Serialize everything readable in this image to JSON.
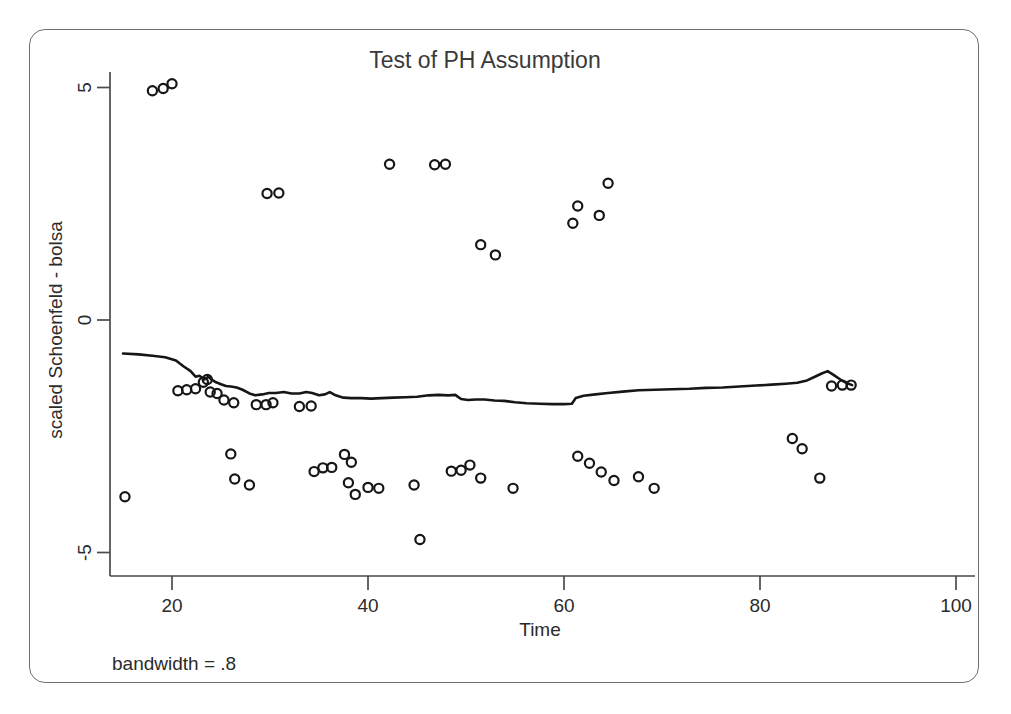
{
  "figure": {
    "title": "Test of PH Assumption",
    "note": "bandwidth = .8",
    "background": "#ffffff",
    "frame_color": "#6f6f6f",
    "marker_color": "#161616",
    "line_color": "#161616"
  },
  "chart_data": {
    "type": "scatter",
    "title": "Test of PH Assumption",
    "xlabel": "Time",
    "ylabel": "scaled Schoenfeld - bolsa",
    "xlim": [
      13.5,
      104
    ],
    "ylim": [
      -5.9,
      5.9
    ],
    "xticks": [
      20,
      40,
      60,
      80,
      100
    ],
    "yticks": [
      5,
      0,
      -5
    ],
    "xtick_labels": [
      "20",
      "40",
      "60",
      "80",
      "100"
    ],
    "ytick_labels": [
      "5",
      "0",
      "-5"
    ],
    "grid": false,
    "legend": "none",
    "annotations": [
      "bandwidth = .8"
    ],
    "series": [
      {
        "name": "scaled Schoenfeld residuals",
        "type": "scatter",
        "marker": "open-circle",
        "points": [
          [
            18.0,
            4.93
          ],
          [
            19.1,
            4.98
          ],
          [
            20.0,
            5.08
          ],
          [
            15.2,
            -3.8
          ],
          [
            20.6,
            -1.52
          ],
          [
            21.5,
            -1.5
          ],
          [
            22.4,
            -1.48
          ],
          [
            23.2,
            -1.34
          ],
          [
            23.6,
            -1.28
          ],
          [
            23.9,
            -1.55
          ],
          [
            24.6,
            -1.58
          ],
          [
            25.3,
            -1.72
          ],
          [
            26.3,
            -1.78
          ],
          [
            26.0,
            -2.88
          ],
          [
            26.4,
            -3.42
          ],
          [
            27.9,
            -3.55
          ],
          [
            28.6,
            -1.82
          ],
          [
            29.6,
            -1.82
          ],
          [
            30.3,
            -1.78
          ],
          [
            29.7,
            2.72
          ],
          [
            30.9,
            2.73
          ],
          [
            33.0,
            -1.86
          ],
          [
            34.2,
            -1.85
          ],
          [
            34.5,
            -3.26
          ],
          [
            35.4,
            -3.18
          ],
          [
            36.3,
            -3.17
          ],
          [
            37.6,
            -2.89
          ],
          [
            38.3,
            -3.06
          ],
          [
            38.0,
            -3.5
          ],
          [
            38.7,
            -3.75
          ],
          [
            40.0,
            -3.6
          ],
          [
            41.1,
            -3.62
          ],
          [
            42.2,
            3.35
          ],
          [
            45.3,
            -4.72
          ],
          [
            44.7,
            -3.55
          ],
          [
            46.8,
            3.34
          ],
          [
            47.9,
            3.35
          ],
          [
            48.5,
            -3.25
          ],
          [
            49.5,
            -3.23
          ],
          [
            50.4,
            -3.12
          ],
          [
            51.5,
            -3.4
          ],
          [
            51.5,
            1.62
          ],
          [
            53.0,
            1.4
          ],
          [
            54.8,
            -3.62
          ],
          [
            60.9,
            2.08
          ],
          [
            61.4,
            2.45
          ],
          [
            63.6,
            2.25
          ],
          [
            64.5,
            2.94
          ],
          [
            61.4,
            -2.93
          ],
          [
            62.6,
            -3.08
          ],
          [
            63.8,
            -3.27
          ],
          [
            65.1,
            -3.45
          ],
          [
            67.6,
            -3.37
          ],
          [
            69.2,
            -3.62
          ],
          [
            83.3,
            -2.55
          ],
          [
            84.3,
            -2.77
          ],
          [
            86.1,
            -3.4
          ],
          [
            87.3,
            -1.42
          ],
          [
            88.4,
            -1.4
          ],
          [
            89.3,
            -1.4
          ]
        ]
      },
      {
        "name": "lowess smooth",
        "type": "line",
        "points": [
          [
            15.0,
            -0.72
          ],
          [
            16.6,
            -0.74
          ],
          [
            18.0,
            -0.77
          ],
          [
            19.3,
            -0.8
          ],
          [
            20.4,
            -0.87
          ],
          [
            21.2,
            -1.0
          ],
          [
            21.9,
            -1.1
          ],
          [
            22.4,
            -1.22
          ],
          [
            22.8,
            -1.2
          ],
          [
            23.3,
            -1.28
          ],
          [
            23.7,
            -1.22
          ],
          [
            24.1,
            -1.29
          ],
          [
            24.5,
            -1.34
          ],
          [
            25.0,
            -1.38
          ],
          [
            25.5,
            -1.42
          ],
          [
            26.0,
            -1.43
          ],
          [
            26.6,
            -1.45
          ],
          [
            27.2,
            -1.5
          ],
          [
            27.9,
            -1.58
          ],
          [
            28.5,
            -1.62
          ],
          [
            29.2,
            -1.6
          ],
          [
            29.9,
            -1.57
          ],
          [
            30.6,
            -1.57
          ],
          [
            31.4,
            -1.55
          ],
          [
            32.2,
            -1.58
          ],
          [
            33.0,
            -1.58
          ],
          [
            33.7,
            -1.55
          ],
          [
            34.3,
            -1.57
          ],
          [
            35.0,
            -1.62
          ],
          [
            35.6,
            -1.6
          ],
          [
            36.1,
            -1.55
          ],
          [
            36.7,
            -1.62
          ],
          [
            37.5,
            -1.67
          ],
          [
            38.3,
            -1.68
          ],
          [
            39.3,
            -1.68
          ],
          [
            40.3,
            -1.69
          ],
          [
            41.4,
            -1.68
          ],
          [
            42.6,
            -1.67
          ],
          [
            43.8,
            -1.66
          ],
          [
            45.0,
            -1.65
          ],
          [
            46.2,
            -1.62
          ],
          [
            47.2,
            -1.61
          ],
          [
            48.2,
            -1.62
          ],
          [
            48.9,
            -1.61
          ],
          [
            49.5,
            -1.7
          ],
          [
            50.2,
            -1.72
          ],
          [
            51.0,
            -1.71
          ],
          [
            51.9,
            -1.71
          ],
          [
            52.9,
            -1.73
          ],
          [
            53.9,
            -1.74
          ],
          [
            55.0,
            -1.77
          ],
          [
            56.2,
            -1.79
          ],
          [
            57.5,
            -1.8
          ],
          [
            58.8,
            -1.81
          ],
          [
            60.0,
            -1.81
          ],
          [
            60.8,
            -1.8
          ],
          [
            61.2,
            -1.68
          ],
          [
            62.0,
            -1.63
          ],
          [
            63.2,
            -1.6
          ],
          [
            64.5,
            -1.57
          ],
          [
            66.0,
            -1.54
          ],
          [
            67.6,
            -1.51
          ],
          [
            69.3,
            -1.5
          ],
          [
            71.0,
            -1.49
          ],
          [
            72.8,
            -1.48
          ],
          [
            74.5,
            -1.46
          ],
          [
            76.2,
            -1.45
          ],
          [
            77.9,
            -1.43
          ],
          [
            79.6,
            -1.41
          ],
          [
            81.2,
            -1.39
          ],
          [
            82.6,
            -1.37
          ],
          [
            83.8,
            -1.35
          ],
          [
            84.8,
            -1.3
          ],
          [
            85.6,
            -1.22
          ],
          [
            86.3,
            -1.15
          ],
          [
            86.9,
            -1.1
          ],
          [
            87.5,
            -1.18
          ],
          [
            88.2,
            -1.28
          ],
          [
            88.8,
            -1.35
          ],
          [
            89.4,
            -1.4
          ]
        ]
      }
    ]
  }
}
